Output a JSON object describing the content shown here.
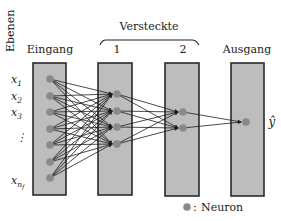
{
  "diagram": {
    "axis_label": "Ebenen",
    "hidden_group_label": "Versteckte",
    "layers": [
      {
        "id": "input",
        "label": "Eingang",
        "x": 33,
        "neuron_x": 50,
        "neurons_y": [
          79,
          96,
          112,
          129,
          145,
          162,
          178
        ]
      },
      {
        "id": "hidden1",
        "label": "1",
        "x": 98,
        "neuron_x": 117,
        "neurons_y": [
          94,
          111,
          127,
          144
        ]
      },
      {
        "id": "hidden2",
        "label": "2",
        "x": 165,
        "neuron_x": 183,
        "neurons_y": [
          112,
          128
        ]
      },
      {
        "id": "output",
        "label": "Ausgang",
        "x": 231,
        "neuron_x": 246,
        "neurons_y": [
          122
        ]
      }
    ],
    "input_labels": [
      {
        "base": "x",
        "sub": "1",
        "y": 79
      },
      {
        "base": "x",
        "sub": "2",
        "y": 96
      },
      {
        "base": "x",
        "sub": "3",
        "y": 112
      },
      {
        "base": "⋮",
        "sub": "",
        "y": 137
      },
      {
        "base": "x",
        "sub": "n",
        "subsub": "f",
        "y": 180
      }
    ],
    "output_label": "ŷ",
    "legend": {
      "separator": ":",
      "label": "Neuron"
    },
    "colors": {
      "layer_fill": "#bdbdbd",
      "layer_border": "#2a2a2a",
      "neuron": "#8a8a8a",
      "edge": "#1e1e1e",
      "text": "#222222"
    }
  }
}
